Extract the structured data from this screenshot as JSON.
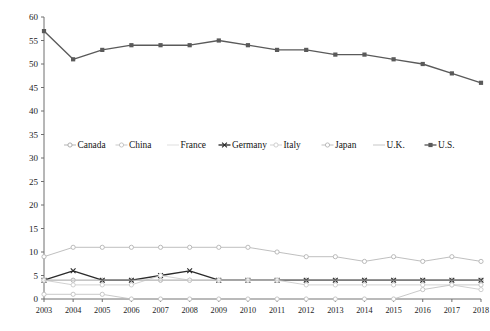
{
  "chart_data": {
    "type": "line",
    "title": "",
    "xlabel": "",
    "ylabel": "",
    "grid": false,
    "legend_position": "middle-center",
    "categories": [
      "2003",
      "2004",
      "2005",
      "2006",
      "2007",
      "2008",
      "2009",
      "2010",
      "2011",
      "2012",
      "2013",
      "2014",
      "2015",
      "2016",
      "2017",
      "2018"
    ],
    "x": [
      2003,
      2004,
      2005,
      2006,
      2007,
      2008,
      2009,
      2010,
      2011,
      2012,
      2013,
      2014,
      2015,
      2016,
      2017,
      2018
    ],
    "ylim": [
      0,
      60
    ],
    "yticks": [
      0,
      5,
      10,
      15,
      20,
      25,
      30,
      35,
      40,
      45,
      50,
      55,
      60
    ],
    "series": [
      {
        "name": "Canada",
        "color": "#a6a6a6",
        "marker": "circle-open",
        "values": [
          4,
          4,
          4,
          4,
          4,
          4,
          4,
          4,
          4,
          4,
          4,
          4,
          4,
          4,
          4,
          4
        ]
      },
      {
        "name": "China",
        "color": "#bfbfbf",
        "marker": "circle-open",
        "values": [
          1,
          1,
          1,
          0,
          0,
          0,
          0,
          0,
          0,
          0,
          0,
          0,
          0,
          2,
          3,
          3
        ]
      },
      {
        "name": "France",
        "color": "#d9d9d9",
        "marker": "none",
        "values": [
          4,
          4,
          4,
          4,
          4,
          4,
          4,
          4,
          4,
          4,
          4,
          4,
          4,
          4,
          4,
          4
        ]
      },
      {
        "name": "Germany",
        "color": "#2b2b2b",
        "marker": "x-cross",
        "values": [
          4,
          6,
          4,
          4,
          5,
          6,
          4,
          4,
          4,
          4,
          4,
          4,
          4,
          4,
          4,
          4
        ]
      },
      {
        "name": "Italy",
        "color": "#c9c9c9",
        "marker": "circle-open",
        "values": [
          4,
          3,
          3,
          3,
          5,
          4,
          4,
          4,
          4,
          3,
          3,
          3,
          3,
          3,
          3,
          2
        ]
      },
      {
        "name": "Japan",
        "color": "#b3b3b3",
        "marker": "circle-open",
        "values": [
          9,
          11,
          11,
          11,
          11,
          11,
          11,
          11,
          10,
          9,
          9,
          8,
          9,
          8,
          9,
          8
        ]
      },
      {
        "name": "U.K.",
        "color": "#bdbdbd",
        "marker": "none",
        "values": [
          4,
          4,
          4,
          4,
          4,
          4,
          4,
          4,
          4,
          4,
          4,
          4,
          4,
          4,
          4,
          4
        ]
      },
      {
        "name": "U.S.",
        "color": "#5a5a5a",
        "marker": "square-solid",
        "values": [
          57,
          51,
          53,
          54,
          54,
          54,
          55,
          54,
          53,
          53,
          52,
          52,
          51,
          50,
          48,
          46
        ]
      }
    ]
  },
  "legend": {
    "items": [
      {
        "label": "Canada"
      },
      {
        "label": "China"
      },
      {
        "label": "France"
      },
      {
        "label": "Germany"
      },
      {
        "label": "Italy"
      },
      {
        "label": "Japan"
      },
      {
        "label": "U.K."
      },
      {
        "label": "U.S."
      }
    ]
  },
  "axes": {
    "y_tick_labels": [
      "60",
      "55",
      "50",
      "45",
      "40",
      "35",
      "30",
      "25",
      "20",
      "15",
      "10",
      "5",
      "0"
    ],
    "x_tick_labels": [
      "2003",
      "2004",
      "2005",
      "2006",
      "2007",
      "2008",
      "2009",
      "2010",
      "2011",
      "2012",
      "2013",
      "2014",
      "2015",
      "2016",
      "2017",
      "2018"
    ]
  }
}
